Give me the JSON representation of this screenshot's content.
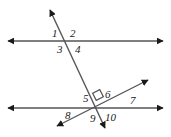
{
  "figure": {
    "stroke_color": "#55555a",
    "label_color": "#1a1a1a",
    "background": "#ffffff",
    "width": 171,
    "height": 137
  },
  "lines": [
    {
      "name": "upper-horizontal-line",
      "x1": 8,
      "y1": 41,
      "x2": 163,
      "y2": 41,
      "arrow_start": true,
      "arrow_end": true
    },
    {
      "name": "lower-horizontal-line",
      "x1": 8,
      "y1": 108,
      "x2": 163,
      "y2": 108,
      "arrow_start": true,
      "arrow_end": true
    },
    {
      "name": "steep-transversal-line",
      "x1": 50,
      "y1": 10,
      "x2": 105,
      "y2": 128,
      "arrow_start": true,
      "arrow_end": true
    },
    {
      "name": "diagonal-transversal-line",
      "x1": 57,
      "y1": 126,
      "x2": 148,
      "y2": 80,
      "arrow_start": true,
      "arrow_end": true
    }
  ],
  "intersections": [
    {
      "name": "upper-intersection",
      "x": 71,
      "y": 41
    },
    {
      "name": "lower-intersection",
      "x": 97,
      "y": 104
    }
  ],
  "right_angle_marker": {
    "name": "right-angle-marker",
    "x": 94,
    "y": 91,
    "size": 8,
    "rotation": -27
  },
  "angle_labels": [
    {
      "id": "1",
      "text": "1",
      "x": 52,
      "y": 28
    },
    {
      "id": "2",
      "text": "2",
      "x": 70,
      "y": 28
    },
    {
      "id": "3",
      "text": "3",
      "x": 57,
      "y": 44
    },
    {
      "id": "4",
      "text": "4",
      "x": 75,
      "y": 44
    },
    {
      "id": "5",
      "text": "5",
      "x": 83,
      "y": 93
    },
    {
      "id": "6",
      "text": "6",
      "x": 105,
      "y": 89
    },
    {
      "id": "7",
      "text": "7",
      "x": 130,
      "y": 95
    },
    {
      "id": "8",
      "text": "8",
      "x": 65,
      "y": 110
    },
    {
      "id": "9",
      "text": "9",
      "x": 90,
      "y": 113
    },
    {
      "id": "10",
      "text": "10",
      "x": 105,
      "y": 112
    }
  ]
}
